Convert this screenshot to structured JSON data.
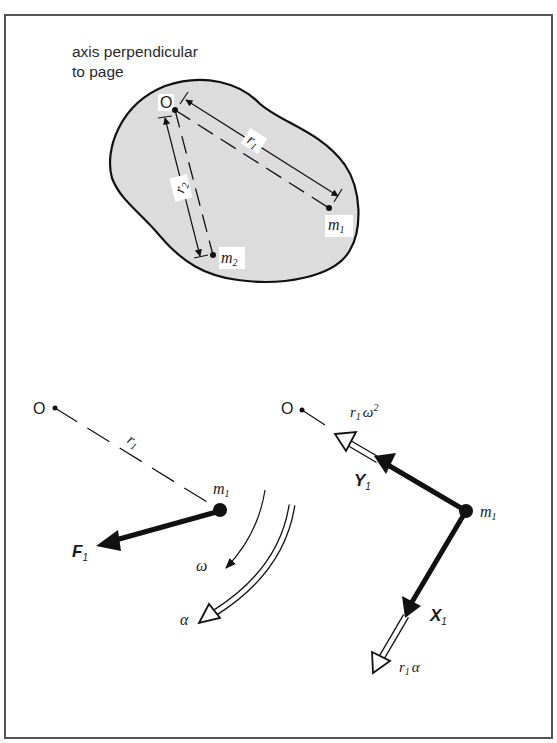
{
  "figure": {
    "caption_lines": [
      "axis perpendicular",
      "to page"
    ],
    "colors": {
      "ink": "#111111",
      "body_fill": "#dcdcdc",
      "frame": "#555555",
      "background": "#ffffff"
    },
    "top_panel": {
      "origin_label": "O",
      "masses": [
        {
          "name": "m",
          "sub": "1"
        },
        {
          "name": "m",
          "sub": "2"
        }
      ],
      "radii": [
        {
          "name": "r",
          "sub": "1"
        },
        {
          "name": "r",
          "sub": "2"
        }
      ]
    },
    "bottom_left_panel": {
      "origin_label": "O",
      "radius_label": {
        "name": "r",
        "sub": "1"
      },
      "mass_label": {
        "name": "m",
        "sub": "1"
      },
      "force_label": {
        "name": "F",
        "sub": "1"
      },
      "angular_velocity_label": "ω",
      "angular_acceleration_label": "α"
    },
    "bottom_right_panel": {
      "origin_label": "O",
      "mass_label": {
        "name": "m",
        "sub": "1"
      },
      "force_components": [
        {
          "name": "Y",
          "sub": "1"
        },
        {
          "name": "X",
          "sub": "1"
        }
      ],
      "acceleration_components": [
        {
          "name": "r",
          "sub": "1",
          "suffix": "ω",
          "sup": "2"
        },
        {
          "name": "r",
          "sub": "1",
          "suffix": "α"
        }
      ]
    }
  }
}
